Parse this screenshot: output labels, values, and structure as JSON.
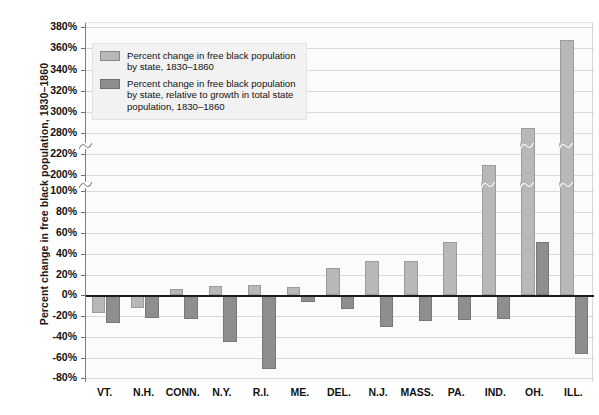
{
  "chart_data": {
    "type": "bar",
    "title": "",
    "xlabel": "",
    "ylabel": "Percent change in free black population, 1830–1860",
    "categories": [
      "VT.",
      "N.H.",
      "CONN.",
      "N.Y.",
      "R.I.",
      "ME.",
      "DEL.",
      "N.J.",
      "MASS.",
      "PA.",
      "IND.",
      "OH.",
      "ILL."
    ],
    "series": [
      {
        "name": "Percent change in free black population by state, 1830–1860",
        "color": "#b8b8b8",
        "values": [
          -17,
          -12,
          6,
          9,
          10,
          8,
          26,
          33,
          33,
          51,
          210,
          285,
          368
        ]
      },
      {
        "name": "Percent change in free black population by state, relative to growth in total state population, 1830–1860",
        "color": "#8e8e8e",
        "values": [
          -27,
          -22,
          -23,
          -45,
          -71,
          -7,
          -13,
          -30,
          -25,
          -24,
          -23,
          51,
          -57
        ]
      }
    ],
    "ytick_labels": [
      "380%",
      "360%",
      "340%",
      "320%",
      "300%",
      "280%",
      "220%",
      "200%",
      "100%",
      "80%",
      "60%",
      "40%",
      "20%",
      "0%",
      "-20%",
      "-40%",
      "-60%",
      "-80%"
    ],
    "ytick_values": [
      380,
      360,
      340,
      320,
      300,
      280,
      220,
      200,
      100,
      80,
      60,
      40,
      20,
      0,
      -20,
      -40,
      -60,
      -80
    ],
    "ylim": [
      -80,
      380
    ],
    "grid": true,
    "axis_breaks": [
      {
        "between": [
          280,
          220
        ]
      },
      {
        "between": [
          200,
          100
        ]
      }
    ],
    "legend_position": "top-left"
  },
  "legend": {
    "entries": [
      {
        "swatch": "light",
        "label": "Percent change in free black population\nby state, 1830–1860"
      },
      {
        "swatch": "dark",
        "label": "Percent change in free black population\nby state, relative to growth in total state\npopulation, 1830–1860"
      }
    ]
  },
  "colors": {
    "series_light": "#b8b8b8",
    "series_dark": "#8e8e8e",
    "zero_line": "#1d1d1d",
    "grid": "#d9d9d9",
    "plot_background": "#fbfbfb",
    "page_background": "#ffffff"
  }
}
